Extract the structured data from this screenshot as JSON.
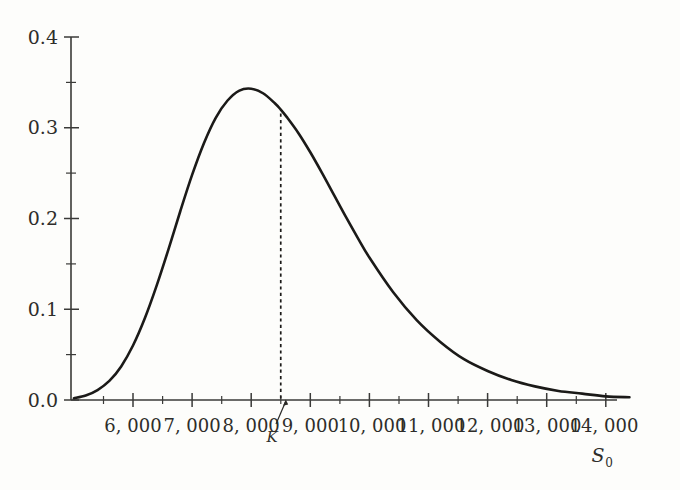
{
  "chart_data": {
    "type": "line",
    "title": "",
    "subtitle": "",
    "xlabel": "S_0",
    "xlabel_display": "S",
    "xlabel_subscript": "0",
    "ylabel": "",
    "xlim": [
      5000,
      14400
    ],
    "ylim": [
      0.0,
      0.4
    ],
    "grid": false,
    "legend": null,
    "x_tick_labels": [
      "6, 000",
      "7, 000",
      "8, 000",
      "9, 000",
      "10, 000",
      "11, 000",
      "12, 000",
      "13, 000",
      "14, 000"
    ],
    "x_tick_values": [
      6000,
      7000,
      8000,
      9000,
      10000,
      11000,
      12000,
      13000,
      14000
    ],
    "x_minor_tick_values": [
      5500,
      6500,
      7500,
      8500,
      9500,
      10500,
      11500,
      12500,
      13500
    ],
    "y_tick_labels": [
      "0.4",
      "0.3",
      "0.2",
      "0.1",
      "0.0"
    ],
    "y_tick_values": [
      0.4,
      0.3,
      0.2,
      0.1,
      0.0
    ],
    "y_minor_tick_values": [
      0.35,
      0.25,
      0.15,
      0.05
    ],
    "annotations": [
      {
        "name": "strike-marker",
        "label": "K",
        "x": 8500,
        "description": "dashed vertical line from curve down to x-axis at K with arrow from label"
      }
    ],
    "series": [
      {
        "name": "lognormal-density",
        "color": "#1b1a18",
        "x": [
          5000,
          5200,
          5400,
          5600,
          5800,
          6000,
          6200,
          6400,
          6600,
          6800,
          7000,
          7200,
          7400,
          7600,
          7800,
          8000,
          8200,
          8400,
          8500,
          8600,
          8800,
          9000,
          9200,
          9400,
          9600,
          9800,
          10000,
          10400,
          10800,
          11200,
          11600,
          12000,
          12400,
          12800,
          13200,
          13600,
          14000,
          14400
        ],
        "y": [
          0.002,
          0.005,
          0.011,
          0.021,
          0.037,
          0.06,
          0.09,
          0.126,
          0.166,
          0.208,
          0.248,
          0.283,
          0.311,
          0.33,
          0.341,
          0.343,
          0.338,
          0.327,
          0.32,
          0.312,
          0.294,
          0.273,
          0.25,
          0.226,
          0.202,
          0.179,
          0.157,
          0.119,
          0.088,
          0.064,
          0.045,
          0.032,
          0.022,
          0.015,
          0.01,
          0.007,
          0.004,
          0.003
        ],
        "y_scale_note": "density values scaled so peak = 0.343 near S_0 = 8,100"
      }
    ],
    "peak": {
      "x": 8100,
      "y": 0.343
    },
    "colors": {
      "curve": "#1b1a18",
      "axis": "#3a3a38",
      "text": "#2e2d2a",
      "background": "#fdfdfb"
    }
  }
}
